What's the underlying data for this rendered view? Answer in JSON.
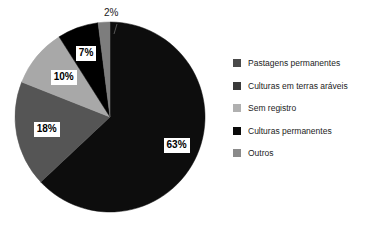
{
  "chart_data": {
    "type": "pie",
    "title": "",
    "legend_position": "right",
    "total": 100,
    "unit": "%",
    "categories": [
      "Pastagens permanentes",
      "Culturas em terras aráveis",
      "Sem registro",
      "Culturas permanentes",
      "Outros"
    ],
    "values": [
      63,
      18,
      10,
      7,
      2
    ],
    "value_labels": [
      "63%",
      "18%",
      "10%",
      "7%",
      "2%"
    ],
    "colors": [
      "#0d0d0d",
      "#555555",
      "#a8a8a8",
      "#000000",
      "#7d7d7d"
    ],
    "slices": [
      {
        "label": "Pastagens permanentes",
        "value": 63,
        "value_label": "63%",
        "color": "#0d0d0d",
        "start_angle": 0,
        "end_angle": 226.8,
        "label_style": "boxed"
      },
      {
        "label": "Culturas em terras aráveis",
        "value": 18,
        "value_label": "18%",
        "color": "#555555",
        "start_angle": 226.8,
        "end_angle": 291.6,
        "label_style": "boxed"
      },
      {
        "label": "Sem registro",
        "value": 10,
        "value_label": "10%",
        "color": "#a8a8a8",
        "start_angle": 291.6,
        "end_angle": 327.6,
        "label_style": "boxed"
      },
      {
        "label": "Culturas permanentes",
        "value": 7,
        "value_label": "7%",
        "color": "#000000",
        "start_angle": 327.6,
        "end_angle": 352.8,
        "label_style": "boxed"
      },
      {
        "label": "Outros",
        "value": 2,
        "value_label": "2%",
        "color": "#7d7d7d",
        "start_angle": 352.8,
        "end_angle": 360,
        "label_style": "outside-leader"
      }
    ]
  },
  "legend": {
    "items": [
      {
        "label": "Pastagens permanentes",
        "color": "#4a4a4a"
      },
      {
        "label": "Culturas em terras aráveis",
        "color": "#3a3a3a"
      },
      {
        "label": "Sem registro",
        "color": "#b0b0b0"
      },
      {
        "label": "Culturas permanentes",
        "color": "#0a0a0a"
      },
      {
        "label": "Outros",
        "color": "#8a8a8a"
      }
    ]
  }
}
